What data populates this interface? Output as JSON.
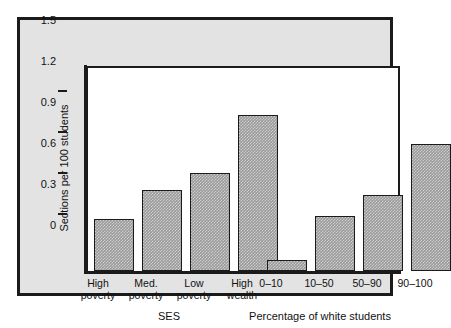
{
  "chart_data": {
    "type": "bar",
    "title": "",
    "xlabel": "",
    "ylabel": "Sections per 100 students",
    "ylim": [
      0,
      1.5
    ],
    "yticks": [
      "0",
      "0.3",
      "0.6",
      "0.9",
      "1.2",
      "1.5"
    ],
    "ytick_values": [
      0,
      0.3,
      0.6,
      0.9,
      1.2,
      1.5
    ],
    "grid": false,
    "legend": "none",
    "groups": [
      {
        "name": "SES",
        "categories": [
          "High\npoverty",
          "Med.\npoverty",
          "Low\npoverty",
          "High\nwealth"
        ],
        "values": [
          0.38,
          0.59,
          0.72,
          1.14
        ]
      },
      {
        "name": "Percentage of white students",
        "categories": [
          "0–10",
          "10–50",
          "50–90",
          "90–100"
        ],
        "values": [
          0.08,
          0.4,
          0.56,
          0.93
        ]
      }
    ],
    "categories": [
      "High poverty",
      "Med. poverty",
      "Low poverty",
      "High wealth",
      "0–10",
      "10–50",
      "50–90",
      "90–100"
    ],
    "values": [
      0.38,
      0.59,
      0.72,
      1.14,
      0.08,
      0.4,
      0.56,
      0.93
    ],
    "colors": {
      "bar_fill": "#9a9a9a",
      "bar_edge": "#1b1b1b",
      "plot_background": "#ffffff",
      "figure_background": "#e3e3e3",
      "frame_border": "#1b1b1b",
      "text": "#111111"
    }
  }
}
